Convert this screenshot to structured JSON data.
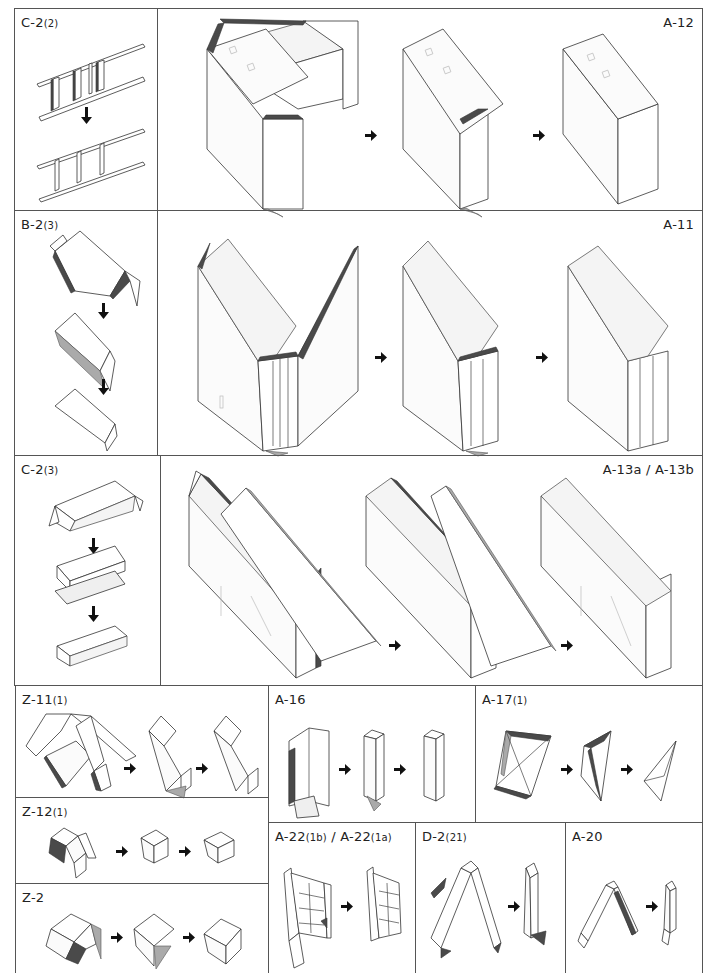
{
  "page": {
    "type": "paper-model-assembly-instructions",
    "background": "#ffffff",
    "border_color": "#555555",
    "accent_dark": "#4a4a4a",
    "accent_mid": "#aaaaaa"
  },
  "panels": [
    {
      "id": "c2-2",
      "label_main": "C-2",
      "label_sub": "(2)",
      "steps": 2,
      "flow": "vertical",
      "description": "Ladder-like part: vertical slats folded onto two rails"
    },
    {
      "id": "a12",
      "label_main": "A-12",
      "label_sub": "",
      "steps": 3,
      "flow": "horizontal",
      "description": "Box body folded closed into a rectangular block"
    },
    {
      "id": "b2-3",
      "label_main": "B-2",
      "label_sub": "(3)",
      "steps": 3,
      "flow": "vertical",
      "description": "Hexagonal prism piece folded flat into a wedge"
    },
    {
      "id": "a11",
      "label_main": "A-11",
      "label_sub": "",
      "steps": 3,
      "flow": "horizontal",
      "description": "Rounded-end body wrapped around curved side"
    },
    {
      "id": "c2-3",
      "label_main": "C-2",
      "label_sub": "(3)",
      "steps": 3,
      "flow": "vertical",
      "description": "Long prism piece folded into a tray"
    },
    {
      "id": "a13",
      "label_main": "A-13a / A-13b",
      "label_sub": "",
      "steps": 3,
      "flow": "horizontal",
      "description": "Long slanted box closed along its spine"
    },
    {
      "id": "z11-1",
      "label_main": "Z-11",
      "label_sub": "(1)",
      "steps": 3,
      "flow": "horizontal",
      "description": "Bent arm piece folded into angled block"
    },
    {
      "id": "a16",
      "label_main": "A-16",
      "label_sub": "",
      "steps": 3,
      "flow": "horizontal",
      "description": "Open sheet folded into square column"
    },
    {
      "id": "a17-1",
      "label_main": "A-17",
      "label_sub": "(1)",
      "steps": 3,
      "flow": "horizontal",
      "description": "Triangular flaps folded into tetrahedron"
    },
    {
      "id": "z12-1",
      "label_main": "Z-12",
      "label_sub": "(1)",
      "steps": 3,
      "flow": "horizontal",
      "description": "Small cube-like piece folded closed"
    },
    {
      "id": "z2",
      "label_main": "Z-2",
      "label_sub": "",
      "steps": 3,
      "flow": "horizontal",
      "description": "Hexagonal piece folded into rhombic block"
    },
    {
      "id": "a22",
      "label_main": "A-22",
      "label_sub": "(1b)",
      "label_main2": " / A-22",
      "label_sub2": "(1a)",
      "steps": 2,
      "flow": "horizontal",
      "description": "Ladder-panel piece folded closed"
    },
    {
      "id": "d2-21",
      "label_main": "D-2",
      "label_sub": "(21)",
      "steps": 2,
      "flow": "horizontal",
      "description": "Inverted V strip folded into a single post"
    },
    {
      "id": "a20",
      "label_main": "A-20",
      "label_sub": "",
      "steps": 2,
      "flow": "horizontal",
      "description": "Inverted V strip folded into a small post"
    }
  ],
  "icons": {
    "step_arrow_right": "arrow-right-icon",
    "step_arrow_down": "arrow-down-icon"
  }
}
